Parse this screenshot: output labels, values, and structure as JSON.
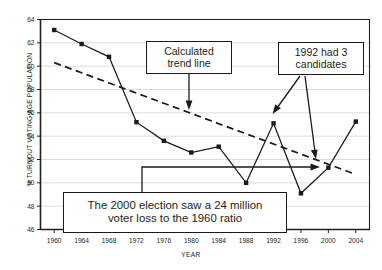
{
  "chart_data": {
    "type": "line",
    "title": "",
    "xlabel": "YEAR",
    "ylabel": "% TURNOUT VOTING AGE POPULATION",
    "categories": [
      1960,
      1964,
      1968,
      1972,
      1976,
      1980,
      1984,
      1988,
      1992,
      1996,
      2000,
      2004
    ],
    "xtick_labels": [
      "1960",
      "1964",
      "1968",
      "1972",
      "1976",
      "1980",
      "1984",
      "1988",
      "1992",
      "1996",
      "2000",
      "2004"
    ],
    "ytick_labels": [
      "46",
      "48",
      "50",
      "52",
      "54",
      "56",
      "58",
      "60",
      "62",
      "64"
    ],
    "yticks": [
      46,
      48,
      50,
      52,
      54,
      56,
      58,
      60,
      62,
      64
    ],
    "ylim": [
      46,
      64
    ],
    "xlim": [
      1958,
      2006
    ],
    "grid": "horizontal",
    "legend": "none",
    "series": [
      {
        "name": "Turnout",
        "style": "solid-marker",
        "color": "#1a1a1a",
        "values": [
          63.1,
          61.9,
          60.8,
          55.2,
          53.6,
          52.6,
          53.1,
          50.0,
          55.1,
          49.1,
          51.3,
          55.25
        ]
      },
      {
        "name": "Calculated trend line",
        "style": "dashed",
        "color": "#1a1a1a",
        "values": [
          60.3,
          59.43,
          58.56,
          57.69,
          56.82,
          55.95,
          55.07,
          54.2,
          53.33,
          52.46,
          51.59,
          50.72
        ]
      }
    ],
    "annotations": [
      {
        "id": "trend",
        "lines": [
          "Calculated",
          "trend line"
        ],
        "points_to": "trend line near 1979"
      },
      {
        "id": "1992",
        "lines": [
          "1992 had 3",
          "candidates"
        ],
        "points_to": "1992 data point and 2000 data point"
      },
      {
        "id": "2000",
        "lines": [
          "The 2000 election saw a 24 million",
          "voter loss to the 1960 ratio"
        ],
        "points_to": "2000 data point"
      }
    ]
  },
  "colors": {
    "axis": "#231f20",
    "grid": "#d9d9d9",
    "series": "#1a1a1a",
    "background": "#ffffff",
    "annotation_border": "#1a1a1a"
  }
}
